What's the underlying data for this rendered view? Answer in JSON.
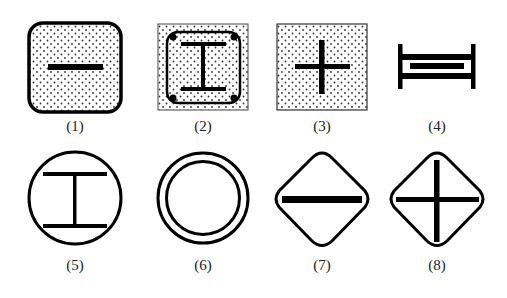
{
  "figure": {
    "symbols": [
      {
        "id": 1,
        "label": "(1)",
        "shape": "rounded-square-dotted",
        "mark": "horizontal-bar"
      },
      {
        "id": 2,
        "label": "(2)",
        "shape": "square-dotted-with-inner-rounded-rect",
        "mark": "i-beam-with-corner-dots"
      },
      {
        "id": 3,
        "label": "(3)",
        "shape": "square-dotted",
        "mark": "plus"
      },
      {
        "id": 4,
        "label": "(4)",
        "shape": "h-frame",
        "mark": "double-bar-with-inner-bar"
      },
      {
        "id": 5,
        "label": "(5)",
        "shape": "circle",
        "mark": "i-beam"
      },
      {
        "id": 6,
        "label": "(6)",
        "shape": "double-circle",
        "mark": "none"
      },
      {
        "id": 7,
        "label": "(7)",
        "shape": "rounded-diamond",
        "mark": "horizontal-bar"
      },
      {
        "id": 8,
        "label": "(8)",
        "shape": "rounded-diamond",
        "mark": "cross"
      }
    ],
    "colors": {
      "stroke": "#000000",
      "background": "#ffffff",
      "dot": "#333333"
    }
  }
}
